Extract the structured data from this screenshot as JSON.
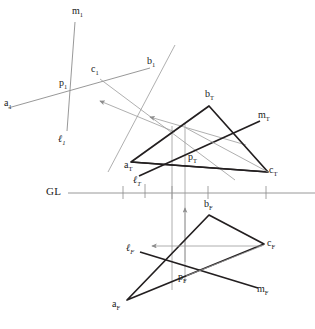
{
  "figure": {
    "type": "descriptive-geometry-projection",
    "title": "",
    "ground_line_label": "GL",
    "colors": {
      "object_line": "#231f20",
      "thin_line": "#8c8c8c",
      "projector_line": "#9a9a9a",
      "ground_line": "#8c8c8c",
      "text": "#1a1a1a",
      "background": "#ffffff"
    }
  },
  "labels": {
    "aux_m": "m",
    "aux_m_sub": "1",
    "aux_a": "a",
    "aux_a_sub": "1",
    "aux_p": "p",
    "aux_p_sub": "1",
    "aux_c": "c",
    "aux_c_sub": "1",
    "aux_b": "b",
    "aux_b_sub": "1",
    "aux_l": "ℓ",
    "aux_l_sub": "1",
    "top_a": "a",
    "top_a_sub": "T",
    "top_b": "b",
    "top_b_sub": "T",
    "top_c": "c",
    "top_c_sub": "T",
    "top_p": "p",
    "top_p_sub": "T",
    "top_m": "m",
    "top_m_sub": "T",
    "top_l": "ℓ",
    "top_l_sub": "T",
    "front_a": "a",
    "front_a_sub": "F",
    "front_b": "b",
    "front_b_sub": "F",
    "front_c": "c",
    "front_c_sub": "F",
    "front_p": "p",
    "front_p_sub": "F",
    "front_m": "m",
    "front_m_sub": "F",
    "front_l": "ℓ",
    "front_l_sub": "F",
    "ground": "GL"
  },
  "geometry": {
    "ground_line": {
      "x1": 68,
      "y1": 193,
      "x2": 315,
      "y2": 193
    },
    "ground_ticks_x": [
      123,
      145,
      172,
      185,
      208,
      266
    ],
    "aux_view": {
      "p": [
        70,
        88
      ],
      "a_end": [
        8,
        108
      ],
      "b_end": [
        150,
        68
      ],
      "c": [
        100,
        79
      ],
      "m_top": [
        75,
        22
      ],
      "l_bottom": [
        67,
        131
      ]
    },
    "top_view": {
      "a": [
        131,
        162
      ],
      "b": [
        209,
        106
      ],
      "c": [
        268,
        172
      ],
      "p": [
        187,
        164
      ],
      "m_end": [
        260,
        121
      ],
      "l_end": [
        139,
        176
      ]
    },
    "front_view": {
      "a": [
        127,
        300
      ],
      "b": [
        209,
        215
      ],
      "c": [
        264,
        244
      ],
      "p": [
        186,
        276
      ],
      "m_end": [
        258,
        288
      ],
      "l_end": [
        140,
        252
      ]
    },
    "projectors_x": [
      172,
      185
    ],
    "arrows": [
      "aux-to-top-1",
      "aux-to-top-2",
      "front-horizontal",
      "front-vertical"
    ]
  }
}
